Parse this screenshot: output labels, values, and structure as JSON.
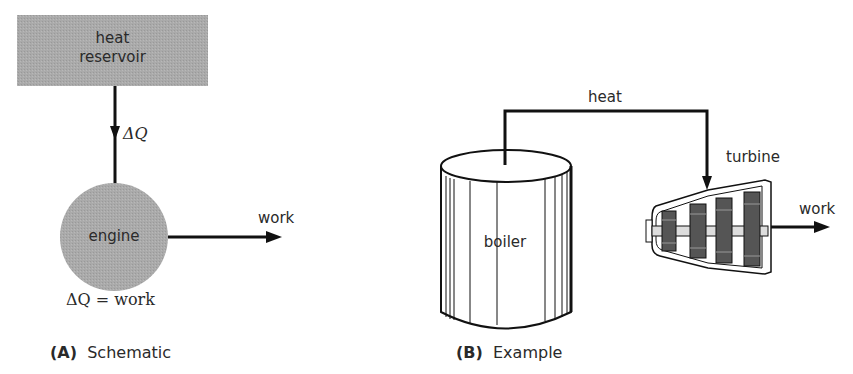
{
  "panel_a": {
    "reservoir_line1": "heat",
    "reservoir_line2": "reservoir",
    "delta_q": "ΔQ",
    "engine": "engine",
    "work": "work",
    "equation": "ΔQ = work",
    "caption_letter": "(A)",
    "caption_text": "Schematic"
  },
  "panel_b": {
    "heat": "heat",
    "boiler": "boiler",
    "turbine": "turbine",
    "work": "work",
    "caption_letter": "(B)",
    "caption_text": "Example"
  },
  "colors": {
    "reservoir_fill": "#a9a9a9",
    "engine_fill": "#a6a6a6",
    "line": "#111111",
    "blade_fill": "#555555"
  }
}
